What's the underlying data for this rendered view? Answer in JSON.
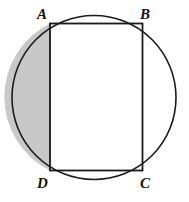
{
  "figure": {
    "kind": "geometry-diagram",
    "background_color": "#ffffff",
    "stroke_color": "#1a1a1a",
    "shaded_color": "#c8c8c8",
    "interior_color": "#ffffff",
    "circle": {
      "center_x": 94,
      "center_y": 97.5,
      "radius": 82,
      "stroke_width": 1.6
    },
    "rectangle": {
      "left": 50,
      "top": 23.5,
      "right": 142.5,
      "bottom": 170.5,
      "width": 92.5,
      "height": 147,
      "stroke_width": 1.8
    },
    "shaded_segment": {
      "side": "left-of-AD",
      "chord_x": 50,
      "chord_top_y": 23.5,
      "chord_bottom_y": 170.5,
      "fill": "#c8c8c8"
    },
    "labels": [
      {
        "id": "A",
        "text": "A",
        "vertex": "top-left",
        "x": 37,
        "y": 7
      },
      {
        "id": "B",
        "text": "B",
        "vertex": "top-right",
        "x": 140,
        "y": 7
      },
      {
        "id": "C",
        "text": "C",
        "vertex": "bottom-right",
        "x": 140,
        "y": 176
      },
      {
        "id": "D",
        "text": "D",
        "vertex": "bottom-left",
        "x": 37,
        "y": 176
      }
    ]
  }
}
